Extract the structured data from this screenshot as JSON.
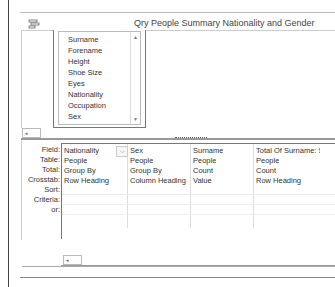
{
  "window": {
    "title": "Qry People Summary Nationality and Gender",
    "icon": "query-design-icon"
  },
  "table_field_list": {
    "fields": [
      "Surname",
      "Forename",
      "Height",
      "Shoe Size",
      "Eyes",
      "Nationality",
      "Occupation",
      "Sex"
    ],
    "scroll_up": "▲",
    "scroll_down": "▼"
  },
  "design_grid": {
    "row_labels": [
      "Field:",
      "Table:",
      "Total:",
      "Crosstab:",
      "Sort:",
      "Criteria:",
      "or:"
    ],
    "columns": [
      {
        "field": "Nationality",
        "table": "People",
        "total": "Group By",
        "crosstab": "Row Heading",
        "sort": "",
        "criteria": "",
        "or": ""
      },
      {
        "field": "Sex",
        "table": "People",
        "total": "Group By",
        "crosstab": "Column Heading",
        "sort": "",
        "criteria": "",
        "or": ""
      },
      {
        "field": "Surname",
        "table": "People",
        "total": "Count",
        "crosstab": "Value",
        "sort": "",
        "criteria": "",
        "or": ""
      },
      {
        "field": "Total Of Surname: Sur",
        "table": "People",
        "total": "Count",
        "crosstab": "Row Heading",
        "sort": "",
        "criteria": "",
        "or": ""
      }
    ],
    "dropdown_glyph": "⌵"
  },
  "scrollbars": {
    "left_arrow": "◂"
  }
}
